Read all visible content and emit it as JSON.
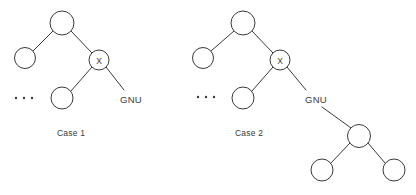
{
  "figure": {
    "background_color": "#ffffff",
    "stroke_color": "#3a3a3a",
    "node_fill": "#ffffff"
  },
  "cases": [
    {
      "id": "case-1",
      "caption": "Case 1",
      "caption_x": 57,
      "caption_y": 136,
      "ellipsis": {
        "x": 16,
        "y": 98,
        "count": 3,
        "spacing": 8
      },
      "nodes": [
        {
          "name": "root",
          "label": "",
          "cx": 62,
          "cy": 23,
          "r": 12
        },
        {
          "name": "left-child",
          "label": "",
          "cx": 25,
          "cy": 58,
          "r": 10.5
        },
        {
          "name": "x-node",
          "label": "X",
          "cx": 99,
          "cy": 60,
          "r": 10
        },
        {
          "name": "x-left-child",
          "label": "",
          "cx": 62,
          "cy": 98,
          "r": 11
        }
      ],
      "edges": [
        {
          "name": "root-to-left-child",
          "x1": 53,
          "y1": 31,
          "x2": 33,
          "y2": 51
        },
        {
          "name": "root-to-x-node",
          "x1": 71,
          "y1": 31,
          "x2": 92,
          "y2": 53
        },
        {
          "name": "x-node-to-left-child",
          "x1": 92,
          "y1": 67,
          "x2": 71,
          "y2": 91
        },
        {
          "name": "x-node-to-gnu",
          "x1": 106,
          "y1": 67,
          "x2": 124,
          "y2": 90
        }
      ],
      "labels": [
        {
          "name": "gnu-label",
          "text": "GNU",
          "x": 120,
          "y": 103
        }
      ]
    },
    {
      "id": "case-2",
      "caption": "Case 2",
      "caption_x": 235,
      "caption_y": 136,
      "ellipsis": {
        "x": 198,
        "y": 97,
        "count": 3,
        "spacing": 8
      },
      "nodes": [
        {
          "name": "root",
          "label": "",
          "cx": 243,
          "cy": 23,
          "r": 12
        },
        {
          "name": "left-child",
          "label": "",
          "cx": 203,
          "cy": 58,
          "r": 10.5
        },
        {
          "name": "x-node",
          "label": "X",
          "cx": 280,
          "cy": 60,
          "r": 10
        },
        {
          "name": "x-left-child",
          "label": "",
          "cx": 243,
          "cy": 98,
          "r": 11
        },
        {
          "name": "gnu-subtree-root",
          "label": "",
          "cx": 359,
          "cy": 136,
          "r": 11.5
        },
        {
          "name": "gnu-subtree-left-leaf",
          "label": "",
          "cx": 322,
          "cy": 170,
          "r": 11
        },
        {
          "name": "gnu-subtree-right-leaf",
          "label": "",
          "cx": 394,
          "cy": 170,
          "r": 11
        }
      ],
      "edges": [
        {
          "name": "root-to-left-child",
          "x1": 234,
          "y1": 31,
          "x2": 211,
          "y2": 51
        },
        {
          "name": "root-to-x-node",
          "x1": 252,
          "y1": 31,
          "x2": 273,
          "y2": 53
        },
        {
          "name": "x-node-to-left-child",
          "x1": 273,
          "y1": 67,
          "x2": 252,
          "y2": 91
        },
        {
          "name": "x-node-to-gnu",
          "x1": 287,
          "y1": 67,
          "x2": 306,
          "y2": 90
        },
        {
          "name": "gnu-to-subtree-root",
          "x1": 322,
          "y1": 107,
          "x2": 351,
          "y2": 128
        },
        {
          "name": "subtree-root-to-left-leaf",
          "x1": 350,
          "y1": 143,
          "x2": 331,
          "y2": 163
        },
        {
          "name": "subtree-root-to-right-leaf",
          "x1": 368,
          "y1": 143,
          "x2": 385,
          "y2": 163
        }
      ],
      "labels": [
        {
          "name": "gnu-label",
          "text": "GNU",
          "x": 305,
          "y": 103
        }
      ]
    }
  ]
}
